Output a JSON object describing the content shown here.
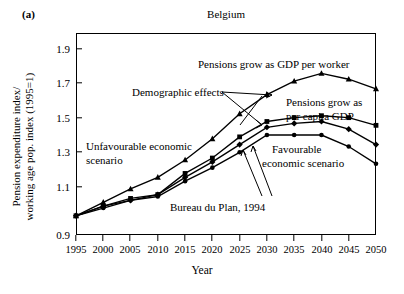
{
  "panel_letter": "(a)",
  "chart_data": {
    "type": "line",
    "title": "Belgium",
    "xlabel": "Year",
    "ylabel": "Pension expenditure index/ working age pop. index (1995=1)",
    "ylabel_line1": "Pension expenditure index/",
    "ylabel_line2": "working age pop. index (1995=1)",
    "x": [
      1995,
      2000,
      2005,
      2010,
      2015,
      2020,
      2025,
      2030,
      2035,
      2040,
      2045,
      2050
    ],
    "xlim": [
      1995,
      2050
    ],
    "ylim": [
      0.9,
      1.95
    ],
    "yticks": [
      0.9,
      1.1,
      1.3,
      1.5,
      1.7,
      1.9
    ],
    "ytick_labels": [
      "0.9",
      "1.1",
      "1.3",
      "1.5",
      "1.7",
      "1.9"
    ],
    "xtick_labels": [
      "1995",
      "2000",
      "2005",
      "2010",
      "2015",
      "2020",
      "2025",
      "2030",
      "2035",
      "2040",
      "2045",
      "2050"
    ],
    "grid": false,
    "legend": "annotations",
    "series": [
      {
        "name": "Demographic effects",
        "marker": "triangle",
        "values": [
          1.0,
          1.07,
          1.14,
          1.2,
          1.29,
          1.4,
          1.53,
          1.63,
          1.7,
          1.74,
          1.71,
          1.66
        ]
      },
      {
        "name": "Pensions grow as GDP per worker",
        "marker": "square",
        "values": [
          1.0,
          1.05,
          1.09,
          1.11,
          1.22,
          1.3,
          1.41,
          1.49,
          1.51,
          1.52,
          1.51,
          1.47
        ]
      },
      {
        "name": "Pensions grow as per capita GDP",
        "marker": "diamond",
        "values": [
          1.0,
          1.05,
          1.08,
          1.11,
          1.2,
          1.28,
          1.37,
          1.46,
          1.48,
          1.49,
          1.45,
          1.37
        ]
      },
      {
        "name": "Favourable economic scenario",
        "marker": "circle",
        "values": [
          1.0,
          1.04,
          1.08,
          1.1,
          1.18,
          1.25,
          1.33,
          1.42,
          1.42,
          1.42,
          1.36,
          1.27
        ]
      }
    ],
    "annotations": [
      {
        "id": "ann-gdp-per-worker",
        "text": "Pensions grow as GDP per worker"
      },
      {
        "id": "ann-demographic-effects",
        "text": "Demographic effects"
      },
      {
        "id": "ann-per-capita-gdp-line1",
        "text": "Pensions grow as"
      },
      {
        "id": "ann-per-capita-gdp-line2",
        "text": "per capita GDP"
      },
      {
        "id": "ann-unfavourable-line1",
        "text": "Unfavourable economic"
      },
      {
        "id": "ann-unfavourable-line2",
        "text": "scenario"
      },
      {
        "id": "ann-favourable-line1",
        "text": "Favourable"
      },
      {
        "id": "ann-favourable-line2",
        "text": "economic scenario"
      },
      {
        "id": "ann-bureau",
        "text": "Bureau du Plan, 1994"
      }
    ]
  }
}
